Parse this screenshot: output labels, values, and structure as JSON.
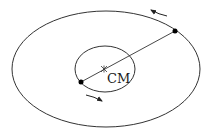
{
  "diagram": {
    "center_of_mass_label": "CM",
    "colors": {
      "stroke": "#333333",
      "body": "#000000",
      "background": "#ffffff"
    },
    "outer_orbit": {
      "cx": 106,
      "cy": 69,
      "rx": 94,
      "ry": 58
    },
    "inner_orbit": {
      "cx": 105,
      "cy": 69,
      "rx": 30,
      "ry": 23
    },
    "bodies": [
      {
        "name": "outer-body",
        "x": 175,
        "y": 31
      },
      {
        "name": "inner-body",
        "x": 81,
        "y": 82
      }
    ],
    "center_of_mass": {
      "x": 104,
      "y": 69
    },
    "arrows": [
      {
        "name": "outer-direction-arrow",
        "from": [
          167,
          16
        ],
        "to": [
          151,
          10
        ],
        "direction": "counterclockwise"
      },
      {
        "name": "inner-direction-arrow",
        "from": [
          86,
          95
        ],
        "to": [
          102,
          101
        ],
        "direction": "counterclockwise"
      }
    ]
  }
}
